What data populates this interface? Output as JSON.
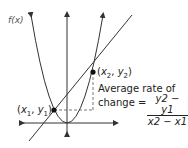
{
  "diagram": {
    "function_label": "f(x)",
    "point1_label": "(x1, y1)",
    "point2_label": "(x2, y2)",
    "annotation_line1": "Average rate of",
    "annotation_line2": "change =",
    "fraction_numerator": "y2 − y1",
    "fraction_denominator": "x2 − x1",
    "colors": {
      "stroke": "#333333",
      "dashed": "#555555",
      "point": "#111111"
    }
  }
}
